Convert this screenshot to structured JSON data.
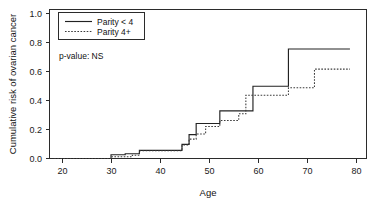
{
  "figure": {
    "background": "#ffffff",
    "foreground": "#1a1a1a"
  },
  "annotation": {
    "pvalue_label": "p-value: NS"
  },
  "legend": {
    "entries": [
      {
        "label": "Parity < 4",
        "style": "solid"
      },
      {
        "label": "Parity 4+",
        "style": "dotted"
      }
    ]
  },
  "chart_data": {
    "type": "line",
    "subtype": "step",
    "title": "",
    "xlabel": "Age",
    "ylabel": "Cumulative risk of ovarian cancer",
    "xlim": [
      17,
      84
    ],
    "ylim": [
      0.0,
      1.0
    ],
    "xticks": [
      20,
      30,
      40,
      50,
      60,
      70,
      80
    ],
    "xtick_labels": [
      "20",
      "30",
      "40",
      "50",
      "60",
      "70",
      "80"
    ],
    "yticks": [
      0.0,
      0.2,
      0.4,
      0.6,
      0.8,
      1.0
    ],
    "ytick_labels": [
      "0.0",
      "0.2",
      "0.4",
      "0.6",
      "0.8",
      "1.0"
    ],
    "grid": false,
    "legend_position": "top-left",
    "annotations": [
      "p-value: NS"
    ],
    "series": [
      {
        "name": "Parity < 4",
        "style": "solid",
        "color": "#222222",
        "x": [
          18,
          30,
          30,
          33,
          33,
          36,
          36,
          37.5,
          37.5,
          45,
          45,
          46.5,
          46.5,
          48,
          48,
          49.5,
          49.5,
          53,
          53,
          58.5,
          58.5,
          60,
          60,
          67.5,
          67.5,
          80.5
        ],
        "y": [
          0.0,
          0.0,
          0.025,
          0.025,
          0.032,
          0.032,
          0.055,
          0.055,
          0.055,
          0.055,
          0.095,
          0.095,
          0.16,
          0.16,
          0.235,
          0.235,
          0.235,
          0.235,
          0.32,
          0.32,
          0.32,
          0.32,
          0.485,
          0.485,
          0.735,
          0.735
        ]
      },
      {
        "name": "Parity 4+",
        "style": "dotted",
        "color": "#3a3a3a",
        "x": [
          18,
          30,
          30,
          34.5,
          34.5,
          36,
          36,
          37.5,
          37.5,
          45,
          45,
          46.5,
          46.5,
          48,
          48,
          50,
          50,
          53,
          53,
          57,
          57,
          58.5,
          58.5,
          60,
          60,
          67.5,
          67.5,
          73,
          73,
          80.5
        ],
        "y": [
          0.0,
          0.0,
          0.012,
          0.012,
          0.022,
          0.022,
          0.052,
          0.052,
          0.052,
          0.052,
          0.09,
          0.09,
          0.13,
          0.13,
          0.165,
          0.165,
          0.215,
          0.215,
          0.255,
          0.255,
          0.3,
          0.3,
          0.425,
          0.425,
          0.425,
          0.425,
          0.475,
          0.475,
          0.6,
          0.6
        ]
      }
    ]
  }
}
